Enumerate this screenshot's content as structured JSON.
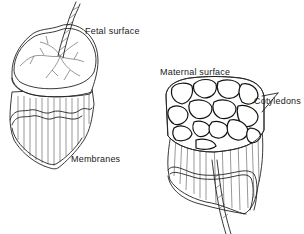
{
  "figure": {
    "labels": {
      "fetal_surface": "Fetal surface",
      "maternal_surface": "Maternal surface",
      "cotyledons": "Cotyledons",
      "membranes": "Membranes"
    },
    "colors": {
      "ink": "#222222",
      "background": "#ffffff"
    }
  }
}
